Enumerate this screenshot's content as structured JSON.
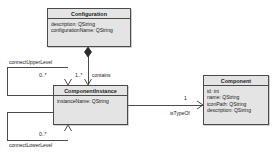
{
  "diagram": {
    "kind": "uml-class-diagram",
    "background": "#ffffff",
    "line_color": "#4a4a4a",
    "class_fill": "#e4e4e4",
    "text_color": "#1a1a1a"
  },
  "classes": {
    "configuration": {
      "name": "Configuration",
      "attributes": [
        "description:  QString",
        "configurationName:  QString"
      ]
    },
    "component_instance": {
      "name": "ComponentInstance",
      "attributes": [
        "instanceName:  QString"
      ]
    },
    "component": {
      "name": "Component",
      "attributes": [
        "id:  int",
        "name:  QString",
        "iconPath:  QString",
        "description:  QString"
      ]
    }
  },
  "relationships": {
    "contains": {
      "label": "contains",
      "source_multiplicity": "1..*",
      "target_multiplicity": "1..*"
    },
    "is_type_of": {
      "label": "isTypeOf",
      "target_multiplicity": "1"
    },
    "connect_upper_level": {
      "label": "connectUpperLevel",
      "multiplicity": "0..*"
    },
    "connect_lower_level": {
      "label": "connectLowerLevel",
      "multiplicity": "0..*"
    }
  }
}
